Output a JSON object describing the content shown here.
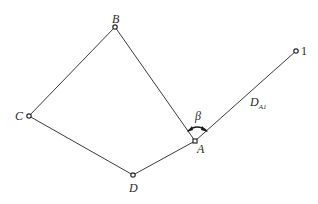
{
  "diagram": {
    "type": "traverse-network",
    "line_color": "#3a3a3a",
    "point_fill": "#ffffff",
    "points": [
      {
        "id": "B",
        "label": "B",
        "x": 115,
        "y": 27
      },
      {
        "id": "C",
        "label": "C",
        "x": 29,
        "y": 116
      },
      {
        "id": "D",
        "label": "D",
        "x": 133,
        "y": 175
      },
      {
        "id": "A",
        "label": "A",
        "x": 195,
        "y": 141
      },
      {
        "id": "1",
        "label": "1",
        "x": 296,
        "y": 51
      }
    ],
    "edges": [
      {
        "from": "B",
        "to": "C"
      },
      {
        "from": "C",
        "to": "D"
      },
      {
        "from": "D",
        "to": "A"
      },
      {
        "from": "A",
        "to": "B"
      },
      {
        "from": "A",
        "to": "1"
      }
    ],
    "angle": {
      "label": "β",
      "vertex": "A",
      "between": [
        "B",
        "1"
      ]
    },
    "distance": {
      "label_main": "D",
      "label_sub": "A1",
      "edge": "A-1"
    }
  }
}
